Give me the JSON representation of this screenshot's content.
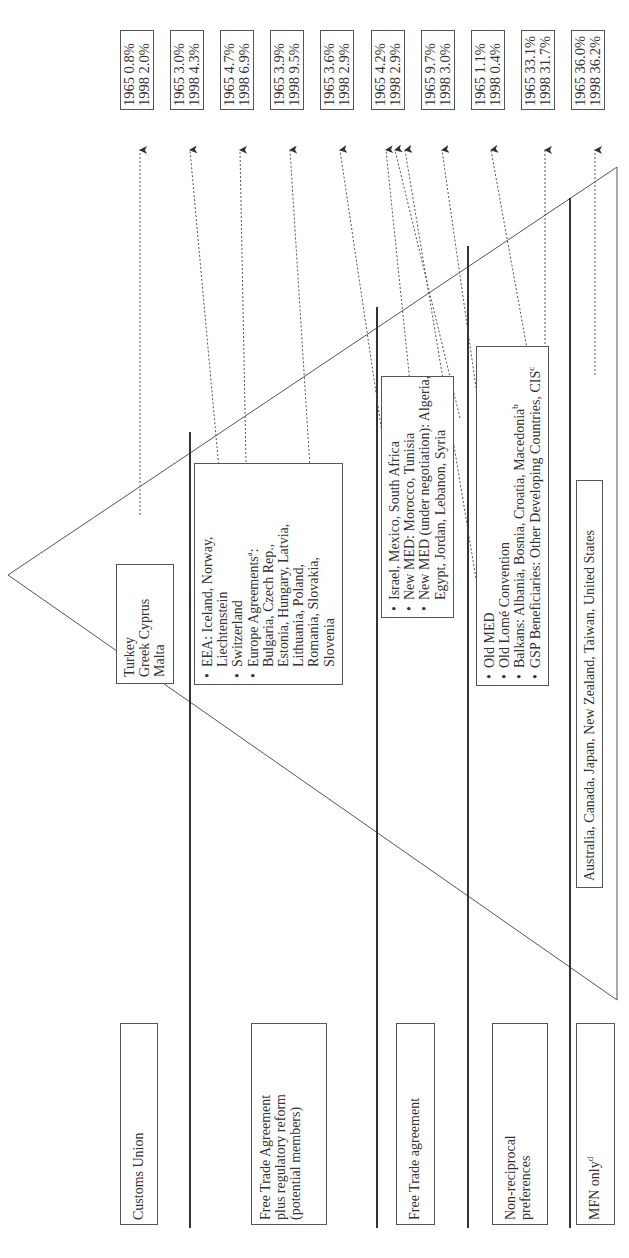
{
  "figure": {
    "orientation": "rotated -90deg (landscape figure printed sideways)",
    "categories": [
      {
        "id": "customs_union",
        "label": "Customs Union"
      },
      {
        "id": "fta_plus",
        "label_lines": [
          "Free Trade Agreement",
          "plus regulatory reform",
          "(potential members)"
        ]
      },
      {
        "id": "fta",
        "label": "Free Trade agreement"
      },
      {
        "id": "nonrecip",
        "label_lines": [
          "Non-reciprocal",
          "preferences"
        ]
      },
      {
        "id": "mfn",
        "label": "MFN only",
        "label_sup": "d"
      }
    ],
    "country_boxes": {
      "customs_union": [
        "Turkey",
        "Greek Cyprus",
        "Malta"
      ],
      "fta_plus": [
        {
          "bullet": true,
          "text": "EEA: Iceland, Norway,"
        },
        {
          "bullet": false,
          "text": "Liechtenstein"
        },
        {
          "bullet": true,
          "text": "Switzerland"
        },
        {
          "bullet": true,
          "text": "Europe Agreements",
          "sup": "a",
          ":": ":"
        },
        {
          "bullet": false,
          "text": "Bulgaria, Czech Rep.,"
        },
        {
          "bullet": false,
          "text": "Estonia, Hungary, Latvia,"
        },
        {
          "bullet": false,
          "text": "Lithuania, Poland,"
        },
        {
          "bullet": false,
          "text": "Romania, Slovakia,"
        },
        {
          "bullet": false,
          "text": "Slovenia"
        }
      ],
      "fta": [
        {
          "bullet": true,
          "text": "Israel, Mexico, South Africa"
        },
        {
          "bullet": true,
          "text": "New MED: Morocco, Tunisia"
        },
        {
          "bullet": true,
          "text": "New MED (under negotiation): Algeria,"
        },
        {
          "bullet": false,
          "text": "Egypt, Jordan, Lebanon, Syria"
        }
      ],
      "nonrecip": [
        {
          "bullet": true,
          "text": "Old MED"
        },
        {
          "bullet": true,
          "text": "Old Lomé Convention"
        },
        {
          "bullet": true,
          "text": "Balkans: Albania, Bosnia, Croatia, Macedonia",
          "sup": "b"
        },
        {
          "bullet": true,
          "text": "GSP Beneficiaries: Other Developing Countries, CIS",
          "sup": "c"
        }
      ],
      "mfn": "Australia, Canada, Japan, New Zealand, Taiwan, United States"
    },
    "trade_shares": [
      {
        "group": "Turkey / Greek Cyprus / Malta",
        "y1965": "1965 0.8%",
        "y1998": "1998 2.0%"
      },
      {
        "group": "EEA",
        "y1965": "1965 3.0%",
        "y1998": "1998 4.3%"
      },
      {
        "group": "Switzerland",
        "y1965": "1965 4.7%",
        "y1998": "1998 6.9%"
      },
      {
        "group": "Europe Agreements",
        "y1965": "1965 3.9%",
        "y1998": "1998 9.5%"
      },
      {
        "group": "Israel, Mexico, South Africa",
        "y1965": "1965 3.6%",
        "y1998": "1998 2.9%"
      },
      {
        "group": "New MED / Old MED",
        "y1965": "1965 4.2%",
        "y1998": "1998 2.9%"
      },
      {
        "group": "Old Lomé Convention",
        "y1965": "1965 9.7%",
        "y1998": "1998 3.0%"
      },
      {
        "group": "Balkans",
        "y1965": "1965 1.1%",
        "y1998": "1998 0.4%"
      },
      {
        "group": "GSP Beneficiaries",
        "y1965": "1965 33.1%",
        "y1998": "1998 31.7%"
      },
      {
        "group": "MFN only",
        "y1965": "1965 36.0%",
        "y1998": "1998 36.2%"
      }
    ]
  }
}
